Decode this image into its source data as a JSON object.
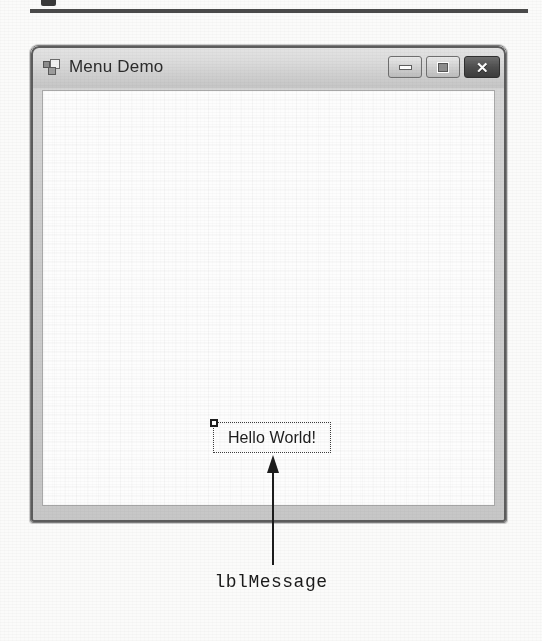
{
  "figure": {
    "annotation_label": "lblMessage",
    "arrow": "up-arrow-callout"
  },
  "form_window": {
    "title": "Menu Demo",
    "icon": "windows-form-icon",
    "buttons": {
      "minimize": "–",
      "maximize": "□",
      "close": "✕"
    },
    "client": {
      "selected_control": {
        "name": "lblMessage",
        "type": "Label",
        "text": "Hello World!",
        "selected": true,
        "handle": "resize-handle"
      }
    }
  },
  "colors": {
    "page_background": "#fbfbfa",
    "rule": "#4a4a4a",
    "titlebar_light": "#e4e4e4",
    "titlebar_dark": "#c5c5c5",
    "form_frame": "#5d5d5d",
    "client_background": "#fdfdfd",
    "close_button": "#4f4f4f",
    "text": "#1c1c1c"
  }
}
